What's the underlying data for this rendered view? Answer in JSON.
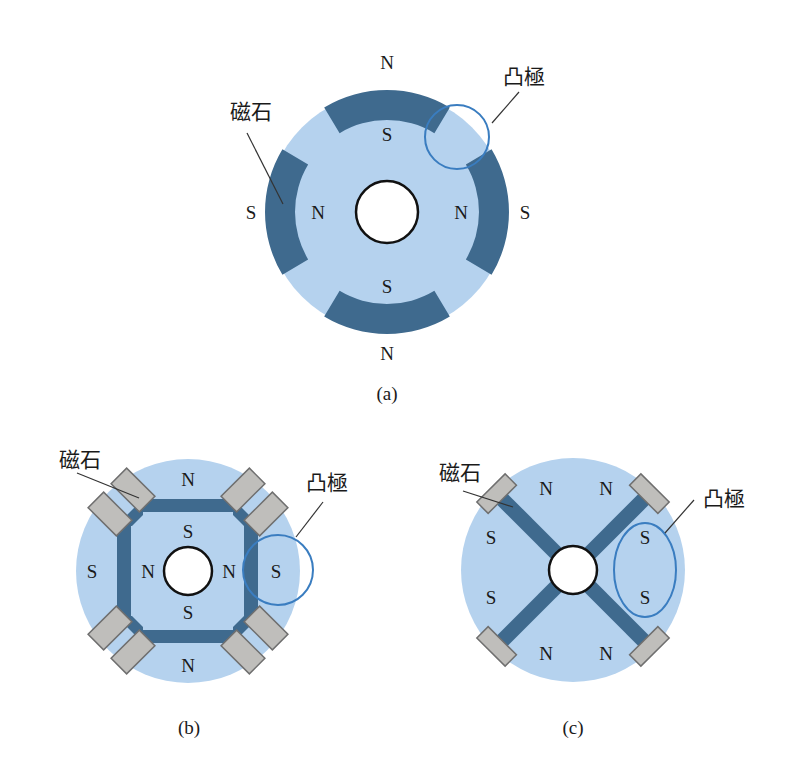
{
  "colors": {
    "rotor_fill": "#b5d2ee",
    "magnet_dark": "#3f6a8e",
    "gray_block_fill": "#bfbebb",
    "gray_block_stroke": "#6f6f6f",
    "shaft_fill": "#ffffff",
    "shaft_stroke": "#111111",
    "highlight_stroke": "#3a7dc0",
    "leader_stroke": "#333333",
    "text": "#1a1a1a"
  },
  "figures": [
    {
      "id": "a",
      "caption": "(a)",
      "caption_pos": [
        387,
        400
      ],
      "type": "surface-arc-magnets",
      "center": [
        387,
        212
      ],
      "outer_radius": 122,
      "inner_magnet_radius": 92,
      "shaft_radius": 31,
      "magnet_arcs": [
        {
          "center_deg": -90,
          "half_span_deg": 31
        },
        {
          "center_deg": 0,
          "half_span_deg": 31
        },
        {
          "center_deg": 90,
          "half_span_deg": 31
        },
        {
          "center_deg": 180,
          "half_span_deg": 31
        }
      ],
      "labels": [
        {
          "text": "N",
          "x": 387,
          "y": 69,
          "role": "outer-pole"
        },
        {
          "text": "S",
          "x": 387,
          "y": 141,
          "role": "inner-pole"
        },
        {
          "text": "S",
          "x": 251,
          "y": 219,
          "role": "outer-pole"
        },
        {
          "text": "N",
          "x": 318,
          "y": 219,
          "role": "inner-pole"
        },
        {
          "text": "N",
          "x": 461,
          "y": 219,
          "role": "inner-pole"
        },
        {
          "text": "S",
          "x": 525,
          "y": 219,
          "role": "outer-pole"
        },
        {
          "text": "S",
          "x": 387,
          "y": 293,
          "role": "inner-pole"
        },
        {
          "text": "N",
          "x": 387,
          "y": 360,
          "role": "outer-pole"
        }
      ],
      "callouts": [
        {
          "text": "磁石",
          "x": 251,
          "y": 119,
          "line": [
            247,
            133,
            283,
            204
          ]
        },
        {
          "text": "凸極",
          "x": 524,
          "y": 84,
          "line": [
            519,
            92,
            492,
            123
          ]
        }
      ],
      "highlight": {
        "shape": "circle",
        "cx": 457,
        "cy": 137,
        "r": 32
      }
    },
    {
      "id": "b",
      "caption": "(b)",
      "caption_pos": [
        189,
        734
      ],
      "type": "square-frame-magnets",
      "center": [
        188,
        571
      ],
      "outer_radius": 112,
      "shaft_radius": 24,
      "bars": [
        {
          "x": 143,
          "y": 499,
          "w": 91,
          "h": 13
        },
        {
          "x": 143,
          "y": 630,
          "w": 91,
          "h": 13
        },
        {
          "x": 117,
          "y": 526,
          "w": 14,
          "h": 92
        },
        {
          "x": 244,
          "y": 526,
          "w": 14,
          "h": 92
        }
      ],
      "gray_blocks": [
        {
          "cx": 133,
          "cy": 490,
          "w": 40,
          "h": 22,
          "rot": 45
        },
        {
          "cx": 110,
          "cy": 514,
          "w": 40,
          "h": 22,
          "rot": 45
        },
        {
          "cx": 243,
          "cy": 490,
          "w": 40,
          "h": 22,
          "rot": -45
        },
        {
          "cx": 266,
          "cy": 514,
          "w": 40,
          "h": 22,
          "rot": -45
        },
        {
          "cx": 110,
          "cy": 628,
          "w": 40,
          "h": 22,
          "rot": -45
        },
        {
          "cx": 133,
          "cy": 652,
          "w": 40,
          "h": 22,
          "rot": -45
        },
        {
          "cx": 243,
          "cy": 652,
          "w": 40,
          "h": 22,
          "rot": 45
        },
        {
          "cx": 266,
          "cy": 628,
          "w": 40,
          "h": 22,
          "rot": 45
        }
      ],
      "labels": [
        {
          "text": "N",
          "x": 188,
          "y": 486,
          "role": "outer-pole"
        },
        {
          "text": "S",
          "x": 188,
          "y": 538,
          "role": "inner-pole"
        },
        {
          "text": "S",
          "x": 92,
          "y": 578,
          "role": "outer-pole"
        },
        {
          "text": "N",
          "x": 148,
          "y": 578,
          "role": "inner-pole"
        },
        {
          "text": "N",
          "x": 229,
          "y": 578,
          "role": "inner-pole"
        },
        {
          "text": "S",
          "x": 276,
          "y": 578,
          "role": "outer-pole"
        },
        {
          "text": "S",
          "x": 188,
          "y": 619,
          "role": "inner-pole"
        },
        {
          "text": "N",
          "x": 188,
          "y": 672,
          "role": "outer-pole"
        }
      ],
      "callouts": [
        {
          "text": "磁石",
          "x": 80,
          "y": 467,
          "line": [
            77,
            473,
            139,
            498
          ]
        },
        {
          "text": "凸極",
          "x": 327,
          "y": 490,
          "line": [
            323,
            502,
            296,
            537
          ]
        }
      ],
      "highlight": {
        "shape": "circle",
        "cx": 278,
        "cy": 570,
        "r": 35
      }
    },
    {
      "id": "c",
      "caption": "(c)",
      "caption_pos": [
        573,
        734
      ],
      "type": "x-spoke-magnets",
      "center": [
        573,
        570
      ],
      "outer_radius": 112,
      "shaft_radius": 24,
      "spoke_width": 15,
      "spoke_length": 100,
      "spoke_angles_deg": [
        45,
        135,
        225,
        315
      ],
      "gray_block": {
        "distance": 108,
        "w": 40,
        "h": 16
      },
      "labels": [
        {
          "text": "N",
          "x": 546,
          "y": 495,
          "role": "pole"
        },
        {
          "text": "N",
          "x": 606,
          "y": 495,
          "role": "pole"
        },
        {
          "text": "S",
          "x": 491,
          "y": 544,
          "role": "pole"
        },
        {
          "text": "S",
          "x": 645,
          "y": 544,
          "role": "pole"
        },
        {
          "text": "S",
          "x": 491,
          "y": 604,
          "role": "pole"
        },
        {
          "text": "S",
          "x": 645,
          "y": 604,
          "role": "pole"
        },
        {
          "text": "N",
          "x": 546,
          "y": 660,
          "role": "pole"
        },
        {
          "text": "N",
          "x": 606,
          "y": 660,
          "role": "pole"
        }
      ],
      "callouts": [
        {
          "text": "磁石",
          "x": 460,
          "y": 480,
          "line": [
            463,
            491,
            513,
            507
          ]
        },
        {
          "text": "凸極",
          "x": 724,
          "y": 506,
          "line": [
            694,
            500,
            665,
            533
          ]
        }
      ],
      "highlight": {
        "shape": "ellipse",
        "cx": 645,
        "cy": 570,
        "rx": 31,
        "ry": 47
      }
    }
  ]
}
